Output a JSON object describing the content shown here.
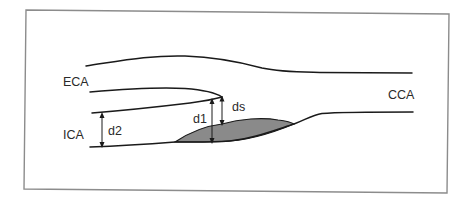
{
  "diagram": {
    "colors": {
      "frame": "#8c8c8c",
      "vessel_wall": "#1a1a1a",
      "plaque_fill": "#8a8a8a",
      "label_text": "#2a2a2a",
      "background": "#ffffff"
    },
    "vessels": [
      {
        "id": "eca",
        "label": "ECA",
        "name": "External carotid artery"
      },
      {
        "id": "ica",
        "label": "ICA",
        "name": "Internal carotid artery"
      },
      {
        "id": "cca",
        "label": "CCA",
        "name": "Common carotid artery"
      }
    ],
    "measurements": [
      {
        "id": "d1",
        "label": "d1",
        "description": "Estimated original lumen diameter at stenosis"
      },
      {
        "id": "d2",
        "label": "d2",
        "description": "Distal normal ICA lumen diameter"
      },
      {
        "id": "ds",
        "label": "ds",
        "description": "Residual lumen diameter at stenosis"
      }
    ],
    "plaque": {
      "label": "",
      "shading": "gray"
    }
  }
}
